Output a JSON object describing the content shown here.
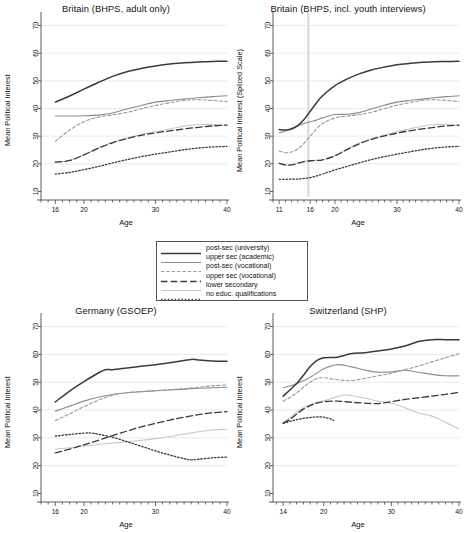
{
  "figure": {
    "width": 464,
    "height": 533,
    "background": "#ffffff"
  },
  "legend": {
    "name": "education-level-legend",
    "items": [
      {
        "label": "post-sec (university)",
        "style": "solid",
        "color": "#3a3a3a",
        "width": 1.5
      },
      {
        "label": "upper sec (academic)",
        "style": "solid",
        "color": "#8c8c8c",
        "width": 1.1
      },
      {
        "label": "post-sec (vocational)",
        "style": "shortdash",
        "color": "#9a9a9a",
        "width": 1.1
      },
      {
        "label": "upper sec (vocational)",
        "style": "longdash",
        "color": "#3a3a3a",
        "width": 1.3
      },
      {
        "label": "lower secondary",
        "style": "solid",
        "color": "#c8c8c8",
        "width": 1.1
      },
      {
        "label": "no educ. qualifications",
        "style": "dotted",
        "color": "#3a3a3a",
        "width": 1.3
      }
    ]
  },
  "chart_data": [
    {
      "panel": "top-left",
      "type": "line",
      "title": "Britain (BHPS, adult only)",
      "xlabel": "Age",
      "ylabel": "Mean Political Interest",
      "xlim": [
        14,
        40
      ],
      "ylim": [
        8,
        72
      ],
      "xticks": [
        16,
        20,
        30,
        40
      ],
      "yticks": [
        10,
        20,
        30,
        40,
        50,
        60,
        70
      ],
      "gridlines": [
        20,
        30,
        40,
        50,
        60,
        70
      ],
      "vline": null,
      "series": [
        {
          "name": "post-sec (university)",
          "x": [
            16,
            18,
            20,
            22,
            24,
            26,
            28,
            30,
            32,
            34,
            36,
            38,
            40
          ],
          "y": [
            42.3,
            44.5,
            47.0,
            49.4,
            51.6,
            53.3,
            54.5,
            55.4,
            56.1,
            56.5,
            56.8,
            57.0,
            57.1
          ]
        },
        {
          "name": "upper sec (academic)",
          "x": [
            16,
            18,
            20,
            22,
            24,
            26,
            28,
            30,
            32,
            34,
            36,
            38,
            40
          ],
          "y": [
            37.3,
            37.3,
            37.4,
            37.6,
            38.4,
            39.8,
            41.1,
            42.3,
            42.9,
            43.4,
            43.9,
            44.3,
            44.6
          ]
        },
        {
          "name": "post-sec (vocational)",
          "x": [
            16,
            18,
            20,
            22,
            24,
            26,
            28,
            30,
            32,
            34,
            36,
            38,
            40
          ],
          "y": [
            28.1,
            32.2,
            35.2,
            36.9,
            37.7,
            38.6,
            39.9,
            41.1,
            42.1,
            42.9,
            43.2,
            42.9,
            42.5
          ]
        },
        {
          "name": "upper sec (vocational)",
          "x": [
            16,
            18,
            20,
            22,
            24,
            26,
            28,
            30,
            32,
            34,
            36,
            38,
            40
          ],
          "y": [
            20.6,
            21.2,
            23.2,
            25.6,
            27.6,
            29.1,
            30.3,
            31.2,
            31.9,
            32.6,
            33.2,
            33.7,
            34.0
          ]
        },
        {
          "name": "lower secondary",
          "x": [
            16,
            18,
            20,
            22,
            24,
            26,
            28,
            30,
            32,
            34,
            36,
            38,
            40
          ],
          "y": [
            20.6,
            21.2,
            23.3,
            25.7,
            27.8,
            29.3,
            30.6,
            31.6,
            32.6,
            33.6,
            34.2,
            34.2,
            33.8
          ]
        },
        {
          "name": "no educ. qualifications",
          "x": [
            16,
            18,
            20,
            22,
            24,
            26,
            28,
            30,
            32,
            34,
            36,
            38,
            40
          ],
          "y": [
            16.3,
            16.9,
            17.9,
            19.0,
            20.3,
            21.5,
            22.6,
            23.5,
            24.3,
            25.1,
            25.7,
            26.1,
            26.3
          ]
        }
      ]
    },
    {
      "panel": "top-right",
      "type": "line",
      "title": "Britain (BHPS, incl. youth interviews)",
      "xlabel": "Age",
      "ylabel": "Mean Political Interest (Spliced Scale)",
      "xlim": [
        10,
        40
      ],
      "ylim": [
        8,
        72
      ],
      "xticks": [
        11,
        16,
        20,
        30,
        40
      ],
      "yticks": [
        10,
        20,
        30,
        40,
        50,
        60,
        70
      ],
      "gridlines": [
        20,
        30,
        40,
        50,
        60,
        70
      ],
      "vline": 15.7,
      "series": [
        {
          "name": "post-sec (university)",
          "x": [
            11,
            12,
            13,
            14,
            15,
            16,
            17,
            18,
            20,
            22,
            24,
            26,
            28,
            30,
            32,
            34,
            36,
            38,
            40
          ],
          "y": [
            32.4,
            32.2,
            32.6,
            33.8,
            36.0,
            39.0,
            42.0,
            44.6,
            48.3,
            50.7,
            52.6,
            54.0,
            55.0,
            55.8,
            56.3,
            56.7,
            56.9,
            57.0,
            57.1
          ]
        },
        {
          "name": "upper sec (academic)",
          "x": [
            11,
            12,
            13,
            14,
            15,
            16,
            17,
            18,
            20,
            22,
            24,
            26,
            28,
            30,
            32,
            34,
            36,
            38,
            40
          ],
          "y": [
            31.2,
            31.9,
            32.9,
            33.8,
            34.6,
            35.2,
            35.8,
            36.6,
            37.8,
            37.9,
            38.6,
            39.9,
            41.2,
            42.3,
            42.9,
            43.4,
            43.9,
            44.3,
            44.6
          ]
        },
        {
          "name": "post-sec (vocational)",
          "x": [
            11,
            12,
            13,
            14,
            15,
            16,
            17,
            18,
            20,
            22,
            24,
            26,
            28,
            30,
            32,
            34,
            36,
            38,
            40
          ],
          "y": [
            24.6,
            24.0,
            24.3,
            25.4,
            27.4,
            30.0,
            32.5,
            34.6,
            36.6,
            37.3,
            37.8,
            38.7,
            40.0,
            41.2,
            42.1,
            42.9,
            43.2,
            42.9,
            42.5
          ]
        },
        {
          "name": "upper sec (vocational)",
          "x": [
            11,
            12,
            13,
            14,
            15,
            16,
            17,
            18,
            20,
            22,
            24,
            26,
            28,
            30,
            32,
            34,
            36,
            38,
            40
          ],
          "y": [
            20.2,
            19.6,
            19.6,
            20.2,
            20.8,
            21.1,
            21.2,
            21.4,
            22.9,
            25.2,
            27.3,
            28.9,
            30.1,
            31.1,
            31.9,
            32.6,
            33.2,
            33.7,
            34.0
          ]
        },
        {
          "name": "lower secondary",
          "x": [
            11,
            12,
            13,
            14,
            15,
            16,
            17,
            18,
            20,
            22,
            24,
            26,
            28,
            30,
            32,
            34,
            36,
            38,
            40
          ],
          "y": [
            20.2,
            19.6,
            19.6,
            20.2,
            20.9,
            21.2,
            21.3,
            21.5,
            23.0,
            25.4,
            27.6,
            29.2,
            30.5,
            31.6,
            32.6,
            33.6,
            34.2,
            34.2,
            33.8
          ]
        },
        {
          "name": "no educ. qualifications",
          "x": [
            11,
            12,
            13,
            14,
            15,
            16,
            17,
            18,
            20,
            22,
            24,
            26,
            28,
            30,
            32,
            34,
            36,
            38,
            40
          ],
          "y": [
            14.4,
            14.4,
            14.5,
            14.5,
            14.7,
            15.0,
            15.6,
            16.3,
            17.8,
            19.1,
            20.4,
            21.6,
            22.6,
            23.5,
            24.3,
            25.1,
            25.7,
            26.1,
            26.3
          ]
        }
      ]
    },
    {
      "panel": "bottom-left",
      "type": "line",
      "title": "Germany (GSOEP)",
      "xlabel": "Age",
      "ylabel": "Mean Political Interest",
      "xlim": [
        14,
        40
      ],
      "ylim": [
        8,
        72
      ],
      "xticks": [
        16,
        20,
        30,
        40
      ],
      "yticks": [
        10,
        20,
        30,
        40,
        50,
        60,
        70
      ],
      "gridlines": [
        20,
        30,
        40,
        50,
        60,
        70
      ],
      "vline": null,
      "series": [
        {
          "name": "post-sec (university)",
          "x": [
            16,
            18,
            20,
            22,
            23,
            24,
            26,
            28,
            30,
            32,
            34,
            35,
            36,
            38,
            40
          ],
          "y": [
            42.9,
            46.8,
            50.2,
            53.3,
            54.5,
            54.5,
            55.1,
            55.7,
            56.3,
            57.0,
            57.8,
            58.2,
            58.0,
            57.6,
            57.5
          ]
        },
        {
          "name": "upper sec (academic)",
          "x": [
            16,
            18,
            20,
            22,
            24,
            26,
            28,
            30,
            32,
            34,
            36,
            38,
            40
          ],
          "y": [
            39.6,
            41.4,
            43.2,
            44.6,
            45.6,
            46.2,
            46.6,
            46.9,
            47.2,
            47.5,
            47.8,
            48.0,
            48.2
          ]
        },
        {
          "name": "post-sec (vocational)",
          "x": [
            16,
            18,
            20,
            22,
            24,
            26,
            28,
            30,
            32,
            34,
            36,
            38,
            40
          ],
          "y": [
            36.2,
            38.6,
            41.2,
            43.5,
            45.3,
            46.2,
            46.6,
            46.9,
            47.3,
            47.7,
            48.2,
            48.7,
            49.0
          ]
        },
        {
          "name": "upper sec (vocational)",
          "x": [
            16,
            18,
            20,
            22,
            24,
            26,
            28,
            30,
            32,
            34,
            36,
            38,
            40
          ],
          "y": [
            24.6,
            25.9,
            27.5,
            29.1,
            30.8,
            32.4,
            33.9,
            35.2,
            36.4,
            37.4,
            38.3,
            39.0,
            39.4
          ]
        },
        {
          "name": "lower secondary",
          "x": [
            16,
            18,
            20,
            22,
            24,
            26,
            28,
            30,
            32,
            34,
            36,
            38,
            40
          ],
          "y": [
            26.0,
            26.4,
            27.0,
            27.6,
            28.1,
            28.6,
            29.1,
            29.7,
            30.4,
            31.3,
            32.2,
            32.8,
            33.1
          ]
        },
        {
          "name": "no educ. qualifications",
          "x": [
            16,
            18,
            20,
            21,
            22,
            24,
            26,
            28,
            30,
            32,
            34,
            35,
            36,
            38,
            40
          ],
          "y": [
            30.6,
            31.2,
            31.7,
            31.7,
            31.3,
            30.2,
            28.6,
            27.0,
            25.3,
            23.8,
            22.5,
            22.1,
            22.3,
            22.8,
            23.1
          ]
        }
      ]
    },
    {
      "panel": "bottom-right",
      "type": "line",
      "title": "Switzerland (SHP)",
      "xlabel": "Age",
      "ylabel": "Mean Political Interest",
      "xlim": [
        12.5,
        40
      ],
      "ylim": [
        8,
        72
      ],
      "xticks": [
        14,
        20,
        30,
        40
      ],
      "yticks": [
        10,
        20,
        30,
        40,
        50,
        60,
        70
      ],
      "gridlines": [
        20,
        30,
        40,
        50,
        60,
        70
      ],
      "vline": null,
      "series": [
        {
          "name": "post-sec (university)",
          "x": [
            14,
            15,
            16,
            17,
            18,
            19,
            20,
            22,
            24,
            26,
            28,
            30,
            32,
            34,
            36,
            38,
            40
          ],
          "y": [
            45.0,
            47.2,
            49.5,
            52.5,
            55.6,
            57.8,
            58.8,
            59.0,
            60.2,
            60.6,
            61.2,
            61.9,
            63.0,
            64.6,
            65.3,
            65.3,
            65.3
          ]
        },
        {
          "name": "upper sec (academic)",
          "x": [
            14,
            15,
            16,
            17,
            18,
            19,
            20,
            22,
            24,
            26,
            28,
            30,
            32,
            34,
            36,
            38,
            40
          ],
          "y": [
            48.0,
            48.6,
            49.5,
            50.5,
            51.8,
            53.3,
            54.8,
            56.3,
            55.6,
            54.4,
            53.6,
            53.7,
            54.3,
            53.6,
            52.8,
            52.3,
            52.3
          ]
        },
        {
          "name": "post-sec (vocational)",
          "x": [
            14,
            15,
            16,
            17,
            18,
            19,
            20,
            22,
            24,
            26,
            28,
            30,
            32,
            34,
            36,
            38,
            40
          ],
          "y": [
            43.2,
            44.5,
            46.2,
            48.2,
            50.0,
            51.3,
            51.6,
            50.9,
            50.6,
            51.3,
            52.3,
            53.2,
            54.5,
            55.8,
            57.3,
            58.8,
            60.2
          ]
        },
        {
          "name": "upper sec (vocational)",
          "x": [
            14,
            15,
            16,
            17,
            18,
            19,
            20,
            22,
            24,
            26,
            28,
            30,
            32,
            34,
            36,
            38,
            40
          ],
          "y": [
            35.2,
            36.6,
            38.5,
            40.3,
            41.6,
            42.5,
            43.0,
            43.2,
            42.8,
            42.5,
            42.3,
            43.0,
            43.8,
            44.4,
            45.0,
            45.6,
            46.3
          ]
        },
        {
          "name": "lower secondary",
          "x": [
            14,
            15,
            16,
            17,
            18,
            19,
            20,
            22,
            23,
            24,
            26,
            28,
            30,
            32,
            34,
            36,
            38,
            40
          ],
          "y": [
            35.6,
            37.2,
            39.2,
            40.8,
            42.0,
            42.8,
            43.3,
            44.8,
            45.4,
            45.2,
            44.3,
            43.2,
            42.4,
            40.8,
            38.9,
            37.8,
            35.6,
            33.2
          ]
        },
        {
          "name": "no educ. qualifications",
          "x": [
            14,
            15,
            16,
            17,
            18,
            19,
            20,
            21,
            21.5
          ],
          "y": [
            35.2,
            35.9,
            36.5,
            37.0,
            37.3,
            37.5,
            37.4,
            36.8,
            36.2
          ]
        }
      ]
    }
  ]
}
